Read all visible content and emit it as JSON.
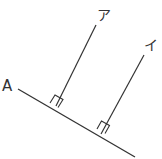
{
  "diagram": {
    "type": "geometry",
    "labels": {
      "base_line": "A",
      "line1": "ア",
      "line2": "イ"
    },
    "line_color": "#333333",
    "right_angle_marks": 2
  }
}
